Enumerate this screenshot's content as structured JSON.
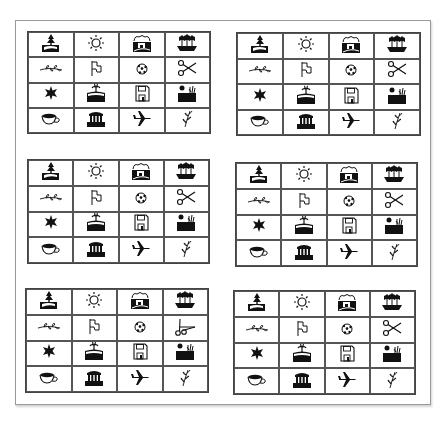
{
  "page": {
    "background": "#ffffff",
    "frame_color": "#9a9a9a",
    "ink": "#111111"
  },
  "icon_set": [
    [
      "tree-landscape",
      "sun",
      "village",
      "ship"
    ],
    [
      "branch",
      "flag",
      "soccer-ball",
      "scissors"
    ],
    [
      "star",
      "palm-island",
      "floppy-disk",
      "sunset-field"
    ],
    [
      "teacup",
      "temple",
      "airplane",
      "herb-sprig"
    ]
  ],
  "grids": [
    {
      "id": "top-left",
      "position": {
        "left": 27,
        "top": 31,
        "width": 182,
        "height": 101
      },
      "cells": [
        [
          "tree-landscape",
          "sun",
          "village",
          "ship"
        ],
        [
          "branch",
          "flag",
          "soccer-ball",
          "scissors"
        ],
        [
          "star",
          "palm-island",
          "floppy-disk",
          "sunset-field"
        ],
        [
          "teacup",
          "temple",
          "airplane",
          "herb-sprig"
        ]
      ]
    },
    {
      "id": "top-right",
      "position": {
        "left": 236,
        "top": 32,
        "width": 183,
        "height": 102
      },
      "cells": [
        [
          "tree-landscape",
          "sun",
          "village",
          "ship"
        ],
        [
          "branch",
          "flag",
          "soccer-ball",
          "scissors"
        ],
        [
          "star",
          "palm-island",
          "floppy-disk",
          "sunset-field"
        ],
        [
          "teacup",
          "temple",
          "airplane",
          "herb-sprig"
        ]
      ]
    },
    {
      "id": "middle-left",
      "position": {
        "left": 27,
        "top": 159,
        "width": 181,
        "height": 103
      },
      "cells": [
        [
          "tree-landscape",
          "sun",
          "village",
          "ship"
        ],
        [
          "branch",
          "flag",
          "soccer-ball",
          "scissors"
        ],
        [
          "star",
          "palm-island",
          "floppy-disk",
          "sunset-field"
        ],
        [
          "teacup",
          "temple",
          "airplane",
          "herb-sprig"
        ]
      ]
    },
    {
      "id": "middle-right",
      "position": {
        "left": 235,
        "top": 162,
        "width": 181,
        "height": 103
      },
      "cells": [
        [
          "tree-landscape",
          "sun",
          "village",
          "ship"
        ],
        [
          "branch",
          "flag",
          "soccer-ball",
          "scissors"
        ],
        [
          "star",
          "palm-island",
          "floppy-disk",
          "sunset-field"
        ],
        [
          "teacup",
          "temple",
          "airplane",
          "herb-sprig"
        ]
      ]
    },
    {
      "id": "bottom-left",
      "position": {
        "left": 25,
        "top": 288,
        "width": 182,
        "height": 103
      },
      "cells": [
        [
          "tree-landscape",
          "sun",
          "village",
          "ship"
        ],
        [
          "branch",
          "flag",
          "soccer-ball",
          "scissors-rotated"
        ],
        [
          "star",
          "palm-island",
          "floppy-disk",
          "sunset-field"
        ],
        [
          "teacup",
          "temple",
          "airplane",
          "herb-sprig"
        ]
      ]
    },
    {
      "id": "bottom-right",
      "position": {
        "left": 233,
        "top": 290,
        "width": 181,
        "height": 103
      },
      "cells": [
        [
          "tree-landscape",
          "sun",
          "village",
          "ship"
        ],
        [
          "branch",
          "flag",
          "soccer-ball",
          "scissors"
        ],
        [
          "star",
          "palm-island",
          "floppy-disk",
          "sunset-field"
        ],
        [
          "teacup",
          "temple",
          "airplane",
          "herb-sprig"
        ]
      ]
    }
  ]
}
